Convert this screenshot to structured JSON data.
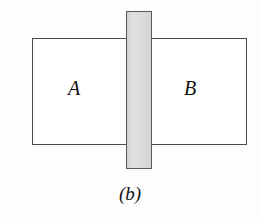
{
  "figure": {
    "caption": "(b)",
    "background_color": "#fdfdfd",
    "vessel": {
      "name": "container-rectangle",
      "stroke_color": "#4a4a4a",
      "fill_color": "#ffffff"
    },
    "partition": {
      "name": "vertical-partition-bar",
      "stroke_color": "#585858",
      "fill_color": "#dedede"
    },
    "chambers": [
      {
        "label": "A",
        "side": "left"
      },
      {
        "label": "B",
        "side": "right"
      }
    ]
  }
}
